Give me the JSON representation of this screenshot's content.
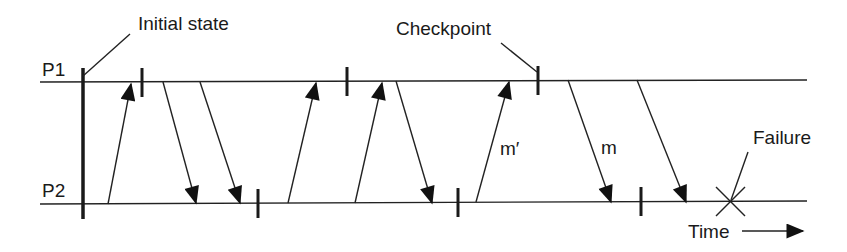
{
  "diagram": {
    "processes": [
      {
        "label": "P1",
        "y": 82
      },
      {
        "label": "P2",
        "y": 204
      }
    ],
    "annotations": {
      "initial_state": "Initial state",
      "checkpoint": "Checkpoint",
      "failure": "Failure",
      "time": "Time",
      "message_m_prime": "m′",
      "message_m": "m"
    },
    "checkpoints": [
      {
        "process": "P1",
        "x": 142
      },
      {
        "process": "P1",
        "x": 347
      },
      {
        "process": "P1",
        "x": 538
      },
      {
        "process": "P2",
        "x": 258
      },
      {
        "process": "P2",
        "x": 458
      },
      {
        "process": "P2",
        "x": 641
      }
    ],
    "messages": [
      {
        "from": "P2",
        "to": "P1",
        "x1": 108,
        "x2": 131
      },
      {
        "from": "P1",
        "to": "P2",
        "x1": 163,
        "x2": 196
      },
      {
        "from": "P1",
        "to": "P2",
        "x1": 200,
        "x2": 240
      },
      {
        "from": "P2",
        "to": "P1",
        "x1": 288,
        "x2": 316
      },
      {
        "from": "P2",
        "to": "P1",
        "x1": 355,
        "x2": 382
      },
      {
        "from": "P1",
        "to": "P2",
        "x1": 396,
        "x2": 432
      },
      {
        "from": "P2",
        "to": "P1",
        "x1": 476,
        "x2": 509,
        "label": "m′"
      },
      {
        "from": "P1",
        "to": "P2",
        "x1": 568,
        "x2": 611,
        "label": "m"
      },
      {
        "from": "P1",
        "to": "P2",
        "x1": 637,
        "x2": 686
      }
    ],
    "failure": {
      "process": "P2",
      "x": 730
    }
  }
}
